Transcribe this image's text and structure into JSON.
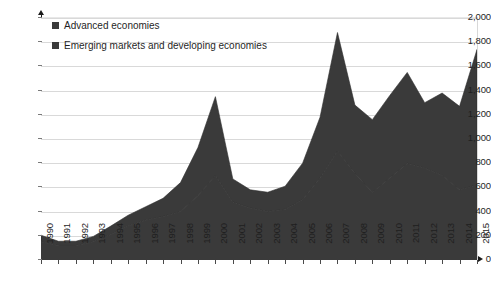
{
  "chart_data": {
    "type": "area",
    "stacked": true,
    "title": "",
    "subtitle": "",
    "xlabel": "",
    "ylabel": "",
    "ylim": [
      0,
      2000
    ],
    "ytick_step": 200,
    "ytick_labels": [
      "0",
      "200",
      "400",
      "600",
      "800",
      "1,000",
      "1,200",
      "1,400",
      "1,600",
      "1,800",
      "2,000"
    ],
    "grid": true,
    "legend_position": "top-left",
    "categories": [
      "1990",
      "1991",
      "1992",
      "1993",
      "1994",
      "1995",
      "1996",
      "1997",
      "1998",
      "1999",
      "2000",
      "2001",
      "2002",
      "2003",
      "2004",
      "2005",
      "2006",
      "2007",
      "2008",
      "2009",
      "2010",
      "2011",
      "2012",
      "2013",
      "2014",
      "2015"
    ],
    "series": [
      {
        "name": "Emerging markets and developing economies",
        "color": "#3a3a3a",
        "values": [
          150,
          120,
          120,
          150,
          210,
          280,
          330,
          360,
          400,
          530,
          700,
          480,
          430,
          400,
          420,
          500,
          680,
          900,
          720,
          560,
          680,
          800,
          760,
          700,
          580,
          620
        ]
      },
      {
        "name": "Advanced economies",
        "color": "#3a3a3a",
        "values": [
          55,
          35,
          35,
          45,
          70,
          90,
          110,
          150,
          240,
          400,
          650,
          190,
          150,
          160,
          190,
          300,
          500,
          980,
          560,
          600,
          680,
          750,
          540,
          680,
          690,
          1120
        ]
      }
    ],
    "totals": [
      205,
      155,
      155,
      195,
      280,
      370,
      440,
      510,
      640,
      930,
      1350,
      670,
      580,
      560,
      610,
      800,
      1180,
      1880,
      1280,
      1160,
      1360,
      1550,
      1300,
      1380,
      1270,
      1740
    ]
  },
  "legend": {
    "items": [
      {
        "label": "Advanced economies",
        "color": "#3a3a3a"
      },
      {
        "label": "Emerging markets and developing economies",
        "color": "#3a3a3a"
      }
    ]
  },
  "caption": ""
}
